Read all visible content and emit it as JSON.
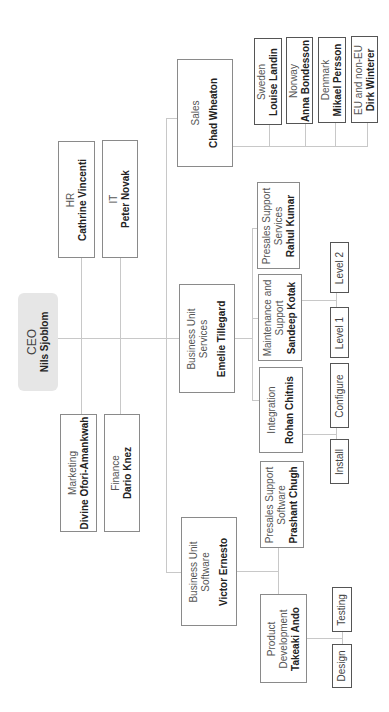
{
  "chart": {
    "orientation": "rotated-90-ccw",
    "ceo": {
      "title": "CEO",
      "name": "Nils Sjoblom"
    },
    "staff": [
      {
        "title": "HR",
        "name": "Cathrine Vincenti"
      },
      {
        "title": "IT",
        "name": "Peter Novak"
      },
      {
        "title": "Marketing",
        "name": "Divine Ofori-Amankwah"
      },
      {
        "title": "Finance",
        "name": "Dario Knez"
      }
    ],
    "sales": {
      "title": "Sales",
      "name": "Chad Wheaton",
      "regions": [
        {
          "title": "Sweden",
          "name": "Louise Landin"
        },
        {
          "title": "Norway",
          "name": "Anna Bondesson"
        },
        {
          "title": "Denmark",
          "name": "Mikael Persson"
        },
        {
          "title": "EU and non-EU",
          "name": "Dirk Winterer"
        }
      ]
    },
    "bu_services": {
      "title_line1": "Business Unit",
      "title_line2": "Services",
      "name": "Emelie Tillegard",
      "presales": {
        "title_line1": "Presales Support",
        "title_line2": "Services",
        "name": "Rahul Kumar"
      },
      "maintenance": {
        "title_line1": "Maintenance and",
        "title_line2": "Support",
        "name": "Sandeep Kotak",
        "children": [
          "Level 1",
          "Level 2"
        ]
      },
      "integration": {
        "title": "Integration",
        "name": "Rohan Chitnis",
        "children": [
          "Install",
          "Configure"
        ]
      }
    },
    "bu_software": {
      "title_line1": "Business Unit",
      "title_line2": "Software",
      "name": "Victor Ernesto",
      "presales": {
        "title_line1": "Presales Support",
        "title_line2": "Software",
        "name": "Prashant Chugh"
      },
      "product_dev": {
        "title_line1": "Product",
        "title_line2": "Development",
        "name": "Takeaki Ando",
        "children": [
          "Design",
          "Testing"
        ]
      }
    }
  }
}
